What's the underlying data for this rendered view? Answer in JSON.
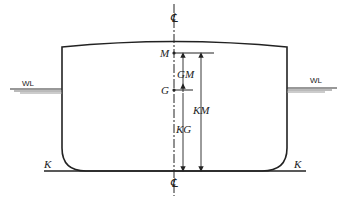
{
  "diagram": {
    "labels": {
      "centerline_top": "℄",
      "centerline_bottom": "℄",
      "metacenter": "M",
      "center_of_gravity": "G",
      "gm": "GM",
      "kg": "KG",
      "km": "KM",
      "waterline_left": "WL",
      "waterline_right": "WL",
      "keel_left": "K",
      "keel_right": "K"
    },
    "colors": {
      "line": "#222222",
      "waterline": "#555555",
      "background": "#ffffff"
    }
  }
}
